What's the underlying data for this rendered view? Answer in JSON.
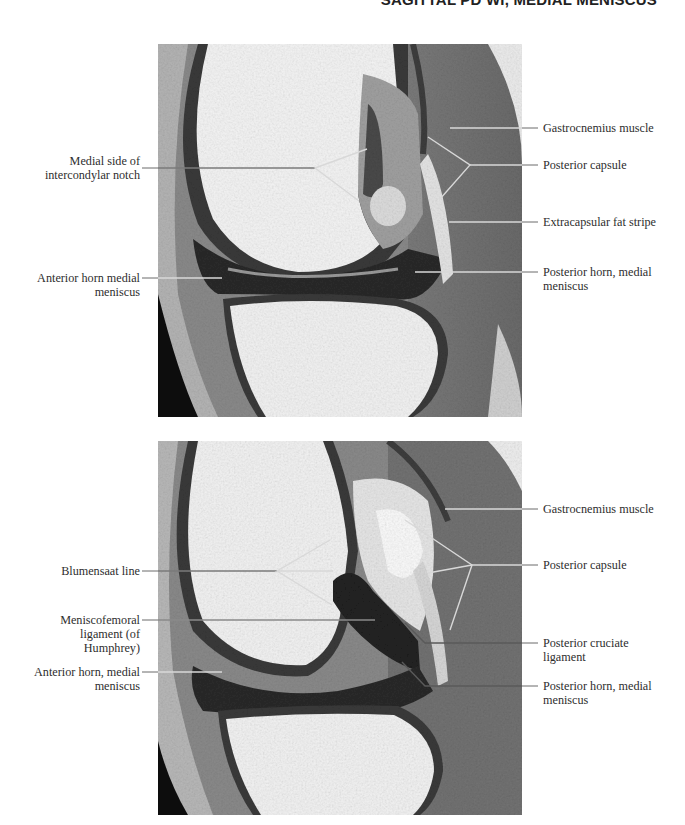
{
  "header": {
    "title": "SAGITTAL PD WI, MEDIAL MENISCUS"
  },
  "figures": [
    {
      "id": "top",
      "description": "Sagittal proton density MRI of knee, medial compartment (upper slice)",
      "labels_left": [
        {
          "text_line1": "Medial side of",
          "text_line2": "intercondylar notch"
        },
        {
          "text_line1": "Anterior horn medial",
          "text_line2": "meniscus"
        }
      ],
      "labels_right": [
        {
          "text_line1": "Gastrocnemius muscle",
          "text_line2": ""
        },
        {
          "text_line1": "Posterior capsule",
          "text_line2": ""
        },
        {
          "text_line1": "Extracapsular fat stripe",
          "text_line2": ""
        },
        {
          "text_line1": "Posterior horn, medial",
          "text_line2": "meniscus"
        }
      ]
    },
    {
      "id": "bottom",
      "description": "Sagittal proton density MRI of knee, near intercondylar notch (lower slice)",
      "labels_left": [
        {
          "text_line1": "Blumensaat line",
          "text_line2": "",
          "text_line3": ""
        },
        {
          "text_line1": "Meniscofemoral",
          "text_line2": "ligament (of",
          "text_line3": "Humphrey)"
        },
        {
          "text_line1": "Anterior horn, medial",
          "text_line2": "meniscus",
          "text_line3": ""
        }
      ],
      "labels_right": [
        {
          "text_line1": "Gastrocnemius muscle",
          "text_line2": ""
        },
        {
          "text_line1": "Posterior capsule",
          "text_line2": ""
        },
        {
          "text_line1": "Posterior cruciate",
          "text_line2": "ligament"
        },
        {
          "text_line1": "Posterior horn, medial",
          "text_line2": "meniscus"
        }
      ]
    }
  ],
  "colors": {
    "background": "#ffffff",
    "leader_dark": "#6a6a6a",
    "leader_light": "#d8d8d8",
    "text": "#2e2e2e"
  }
}
